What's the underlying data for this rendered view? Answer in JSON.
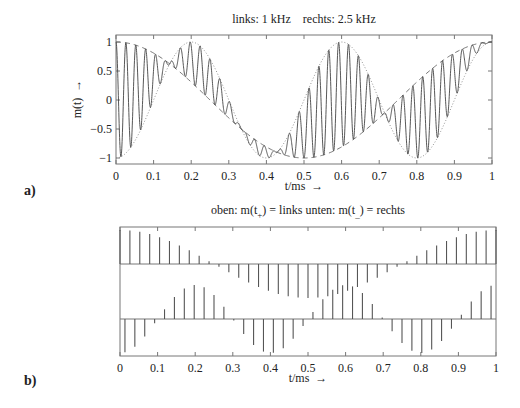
{
  "chart_data": [
    {
      "id": "a",
      "type": "line",
      "panel_label": "a)",
      "title": "links: 1 kHz    rechts: 2.5 kHz",
      "xlabel": "t/ms  →",
      "ylabel": "m(t)  →",
      "xlim": [
        0,
        1
      ],
      "ylim": [
        -1.08,
        1.08
      ],
      "xticks": [
        "0",
        "0.1",
        "0.2",
        "0.3",
        "0.4",
        "0.5",
        "0.6",
        "0.7",
        "0.8",
        "0.9",
        "1"
      ],
      "yticks": [
        "1",
        "0.5",
        "0",
        "-0.5",
        "-1"
      ],
      "ytick_values": [
        1,
        0.5,
        0,
        -0.5,
        -1
      ],
      "grid": false,
      "series": [
        {
          "name": "links (1 kHz)",
          "style": "dashed",
          "formula": "cos(2*pi*1*t)"
        },
        {
          "name": "rechts (2.5 kHz)",
          "style": "dotted",
          "formula": "-cos(2*pi*2.5*t)"
        },
        {
          "name": "m(t) multiplex",
          "style": "solid",
          "formula": "L*(1+cos(2*pi*38*t))/2 + R*(1-cos(2*pi*38*t))/2"
        }
      ],
      "carrier_khz": 38,
      "link_freq_khz": 1,
      "rechts_freq_khz": 2.5
    },
    {
      "id": "b",
      "type": "stem",
      "panel_label": "b)",
      "title_parts": {
        "oben": "oben: m(t",
        "oben_sub": "+",
        "oben_rest": ") = links",
        "unten": "unten: m(t",
        "unten_sub": "−",
        "unten_rest": ") = rechts"
      },
      "xlabel": "t/ms  →",
      "xlim": [
        0,
        1
      ],
      "xticks": [
        "0",
        "0.1",
        "0.2",
        "0.3",
        "0.4",
        "0.5",
        "0.6",
        "0.7",
        "0.8",
        "0.9",
        "1"
      ],
      "grid": false,
      "series": [
        {
          "name": "oben: m(t+) = links",
          "formula": "cos(2*pi*1*t) sampled at 38 kHz"
        },
        {
          "name": "unten: m(t-) = rechts",
          "formula": "-cos(2*pi*2.5*t) sampled at 38 kHz, offset half period"
        }
      ]
    }
  ]
}
